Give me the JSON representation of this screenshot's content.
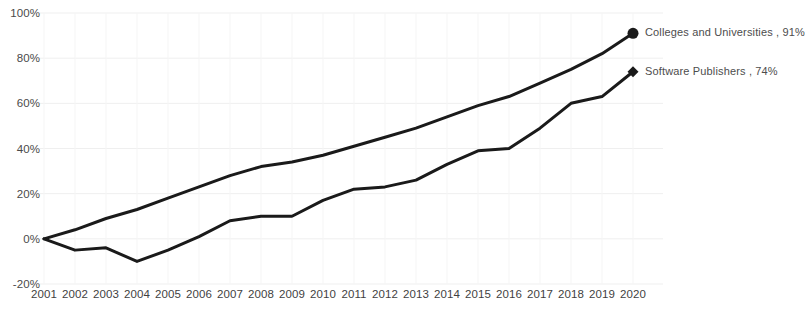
{
  "chart_data": {
    "type": "line",
    "title": "",
    "subtitle": "",
    "xlabel": "",
    "ylabel": "",
    "x": [
      2001,
      2002,
      2003,
      2004,
      2005,
      2006,
      2007,
      2008,
      2009,
      2010,
      2011,
      2012,
      2013,
      2014,
      2015,
      2016,
      2017,
      2018,
      2019,
      2020
    ],
    "categories": [
      "2001",
      "2002",
      "2003",
      "2004",
      "2005",
      "2006",
      "2007",
      "2008",
      "2009",
      "2010",
      "2011",
      "2012",
      "2013",
      "2014",
      "2015",
      "2016",
      "2017",
      "2018",
      "2019",
      "2020"
    ],
    "ylim": [
      -20,
      100
    ],
    "xlim": [
      2001,
      2020
    ],
    "y_ticks": [
      -20,
      0,
      20,
      40,
      60,
      80,
      100
    ],
    "y_tick_labels": [
      "-20%",
      "0%",
      "20%",
      "40%",
      "60%",
      "80%",
      "100%"
    ],
    "grid": true,
    "legend_position": "right-inline-end-labels",
    "series": [
      {
        "name": "Colleges and Universities",
        "end_label": "Colleges and Universities , 91%",
        "end_value": 91,
        "marker": "circle",
        "color": "#1a1a1a",
        "values": [
          0,
          4,
          9,
          13,
          18,
          23,
          28,
          32,
          34,
          37,
          41,
          45,
          49,
          54,
          59,
          63,
          69,
          75,
          82,
          91
        ]
      },
      {
        "name": "Software Publishers",
        "end_label": "Software Publishers , 74%",
        "end_value": 74,
        "marker": "diamond",
        "color": "#1a1a1a",
        "values": [
          0,
          -5,
          -4,
          -10,
          -5,
          1,
          8,
          10,
          10,
          17,
          22,
          23,
          26,
          33,
          39,
          40,
          49,
          60,
          63,
          74
        ]
      }
    ]
  },
  "axis": {
    "y_labels": [
      "100%",
      "80%",
      "60%",
      "40%",
      "20%",
      "0%",
      "-20%"
    ],
    "x_labels": [
      "2001",
      "2002",
      "2003",
      "2004",
      "2005",
      "2006",
      "2007",
      "2008",
      "2009",
      "2010",
      "2011",
      "2012",
      "2013",
      "2014",
      "2015",
      "2016",
      "2017",
      "2018",
      "2019",
      "2020"
    ]
  },
  "style": {
    "line_color": "#1a1a1a",
    "grid_color": "#efefef",
    "axis_color": "#d9d9d9",
    "background": "#ffffff",
    "text_color": "#444444"
  }
}
